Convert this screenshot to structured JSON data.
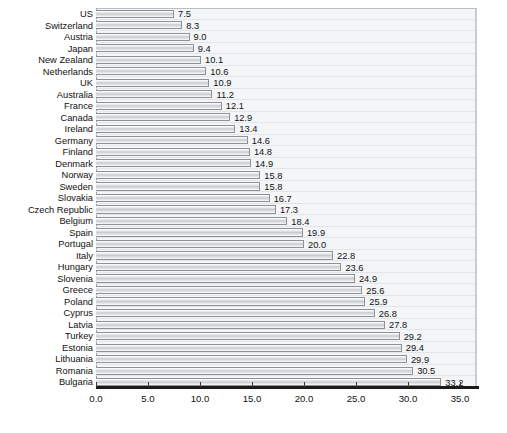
{
  "chart_data": {
    "type": "bar",
    "orientation": "horizontal",
    "title": "",
    "subtitle": "",
    "xlabel": "",
    "ylabel": "",
    "xlim": [
      0.0,
      36.5
    ],
    "xticks": [
      "0.0",
      "5.0",
      "10.0",
      "15.0",
      "20.0",
      "25.0",
      "30.0",
      "35.0"
    ],
    "xtick_values": [
      0.0,
      5.0,
      10.0,
      15.0,
      20.0,
      25.0,
      30.0,
      35.0
    ],
    "grid": true,
    "legend": "none",
    "value_label_format": "one-decimal",
    "categories": [
      "US",
      "Switzerland",
      "Austria",
      "Japan",
      "New Zealand",
      "Netherlands",
      "UK",
      "Australia",
      "France",
      "Canada",
      "Ireland",
      "Germany",
      "Finland",
      "Denmark",
      "Norway",
      "Sweden",
      "Slovakia",
      "Czech Republic",
      "Belgium",
      "Spain",
      "Portugal",
      "Italy",
      "Hungary",
      "Slovenia",
      "Greece",
      "Poland",
      "Cyprus",
      "Latvia",
      "Turkey",
      "Estonia",
      "Lithuania",
      "Romania",
      "Bulgaria"
    ],
    "values": [
      7.5,
      8.3,
      9.0,
      9.4,
      10.1,
      10.6,
      10.9,
      11.2,
      12.1,
      12.9,
      13.4,
      14.6,
      14.8,
      14.9,
      15.8,
      15.8,
      16.7,
      17.3,
      18.4,
      19.9,
      20.0,
      22.8,
      23.6,
      24.9,
      25.6,
      25.9,
      26.8,
      27.8,
      29.2,
      29.4,
      29.9,
      30.5,
      33.2
    ],
    "value_labels": [
      "7.5",
      "8.3",
      "9.0",
      "9.4",
      "10.1",
      "10.6",
      "10.9",
      "11.2",
      "12.1",
      "12.9",
      "13.4",
      "14.6",
      "14.8",
      "14.9",
      "15.8",
      "15.8",
      "16.7",
      "17.3",
      "18.4",
      "19.9",
      "20.0",
      "22.8",
      "23.6",
      "24.9",
      "25.6",
      "25.9",
      "26.8",
      "27.8",
      "29.2",
      "29.4",
      "29.9",
      "30.5",
      "33.2"
    ],
    "colors": {
      "bar_fill": "#c9cbcd",
      "bar_border": "#8d9298",
      "plot_background": "#f3f5f7",
      "axis_line": "#1b1b1b",
      "text": "#111111",
      "gridline": "#e3e6e9"
    }
  }
}
